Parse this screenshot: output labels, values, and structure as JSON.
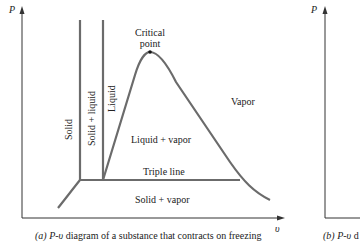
{
  "panel_a": {
    "y_axis_label": "P",
    "x_axis_label": "υ",
    "regions": {
      "solid": "Solid",
      "solid_liquid": "Solid + liquid",
      "liquid": "Liquid",
      "liquid_vapor": "Liquid + vapor",
      "vapor": "Vapor",
      "solid_vapor": "Solid + vapor"
    },
    "critical_point": [
      "Critical",
      "point"
    ],
    "triple_line": "Triple line",
    "caption_prefix": "(a) ",
    "caption_pv": "P-υ",
    "caption_rest": " diagram of a substance that contracts on freezing"
  },
  "panel_b": {
    "y_axis_label": "P",
    "caption_prefix": "(b) ",
    "caption_pv": "P-υ",
    "caption_rest": " d"
  },
  "colors": {
    "curve": "#6b6b6b",
    "axis": "#333333",
    "text": "#222222"
  }
}
